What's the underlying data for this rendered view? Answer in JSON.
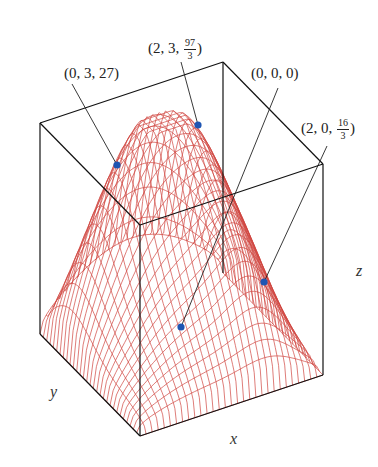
{
  "figure": {
    "type": "3d-surface-wireframe",
    "surface_color": "#d0453f",
    "box_color": "#111111",
    "point_color": "#1e55b3",
    "axes": {
      "x_label": "x",
      "y_label": "y",
      "z_label": "z"
    }
  },
  "points": [
    {
      "label_prefix": "(0, 3, 27)",
      "coords": [
        0,
        3,
        27
      ],
      "has_fraction": false
    },
    {
      "label_prefix": "(2, 3, ",
      "num": "97",
      "den": "3",
      "label_suffix": ")",
      "coords": [
        2,
        3,
        "97/3"
      ],
      "has_fraction": true
    },
    {
      "label_prefix": "(0, 0, 0)",
      "coords": [
        0,
        0,
        0
      ],
      "has_fraction": false
    },
    {
      "label_prefix": "(2, 0, ",
      "num": "16",
      "den": "3",
      "label_suffix": ")",
      "coords": [
        2,
        0,
        "16/3"
      ],
      "has_fraction": true
    }
  ]
}
